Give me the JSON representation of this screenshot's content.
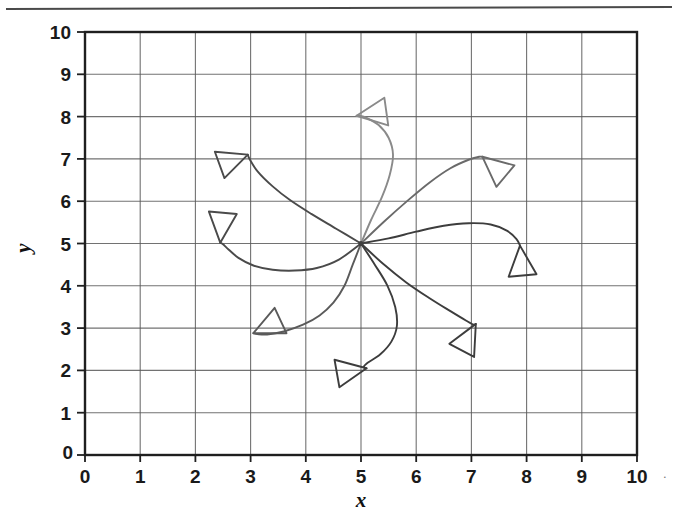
{
  "figure": {
    "background_color": "#ffffff",
    "ink_color": "#3f3f3f",
    "grid_color": "#5a5a5a",
    "axis_color": "#1f1f1f",
    "top_rule_present": true,
    "trailing_artifact": "."
  },
  "chart_data": {
    "type": "line",
    "title": "",
    "subtitle": "",
    "xlabel": "x",
    "ylabel": "y",
    "xlim": [
      0,
      10
    ],
    "ylim": [
      0,
      10
    ],
    "xticks": [
      0,
      1,
      2,
      3,
      4,
      5,
      6,
      7,
      8,
      9,
      10
    ],
    "yticks": [
      0,
      1,
      2,
      3,
      4,
      5,
      6,
      7,
      8,
      9,
      10
    ],
    "xtick_labels": [
      "0",
      "1",
      "2",
      "3",
      "4",
      "5",
      "6",
      "7",
      "8",
      "9",
      "10"
    ],
    "ytick_labels": [
      "0",
      "1",
      "2",
      "3",
      "4",
      "5",
      "6",
      "7",
      "8",
      "9",
      "10"
    ],
    "grid": true,
    "grid_style": "solid",
    "legend": false,
    "legend_position": "none",
    "annotations": [],
    "convergence_point": [
      5,
      5
    ],
    "marker_shape": "open-triangle-arrowhead",
    "series": [
      {
        "name": "path-1-up-left",
        "color": "#4a4a4a",
        "arrow_tip": [
          2.95,
          7.1
        ],
        "arrow_angle_deg": 20,
        "points": [
          [
            5.0,
            5.0
          ],
          [
            4.55,
            5.35
          ],
          [
            4.1,
            5.7
          ],
          [
            3.72,
            6.02
          ],
          [
            3.4,
            6.35
          ],
          [
            3.13,
            6.7
          ],
          [
            2.98,
            7.0
          ],
          [
            2.95,
            7.1
          ]
        ]
      },
      {
        "name": "path-2-left-down-hook",
        "color": "#4a4a4a",
        "arrow_tip": [
          2.45,
          5.02
        ],
        "arrow_angle_deg": 265,
        "points": [
          [
            5.0,
            5.0
          ],
          [
            4.6,
            4.62
          ],
          [
            4.2,
            4.42
          ],
          [
            3.8,
            4.36
          ],
          [
            3.4,
            4.38
          ],
          [
            3.05,
            4.48
          ],
          [
            2.78,
            4.66
          ],
          [
            2.6,
            4.86
          ],
          [
            2.5,
            4.98
          ],
          [
            2.45,
            5.02
          ]
        ]
      },
      {
        "name": "path-3-down-left",
        "color": "#5a5a5a",
        "arrow_tip": [
          3.05,
          2.88
        ],
        "arrow_angle_deg": 205,
        "points": [
          [
            5.0,
            5.0
          ],
          [
            4.85,
            4.5
          ],
          [
            4.7,
            4.0
          ],
          [
            4.5,
            3.6
          ],
          [
            4.25,
            3.3
          ],
          [
            3.95,
            3.08
          ],
          [
            3.6,
            2.92
          ],
          [
            3.3,
            2.85
          ],
          [
            3.12,
            2.86
          ],
          [
            3.05,
            2.88
          ]
        ]
      },
      {
        "name": "path-4-down-right-hook",
        "color": "#3d3d3d",
        "arrow_tip": [
          5.1,
          2.05
        ],
        "arrow_angle_deg": 10,
        "points": [
          [
            5.0,
            5.0
          ],
          [
            5.25,
            4.5
          ],
          [
            5.48,
            4.0
          ],
          [
            5.62,
            3.5
          ],
          [
            5.65,
            3.05
          ],
          [
            5.55,
            2.68
          ],
          [
            5.35,
            2.38
          ],
          [
            5.12,
            2.18
          ],
          [
            5.05,
            2.08
          ],
          [
            5.1,
            2.05
          ]
        ]
      },
      {
        "name": "path-5-down-right-arrow",
        "color": "#3d3d3d",
        "arrow_tip": [
          7.08,
          3.1
        ],
        "arrow_angle_deg": 62,
        "points": [
          [
            5.0,
            5.0
          ],
          [
            5.4,
            4.52
          ],
          [
            5.82,
            4.08
          ],
          [
            6.25,
            3.7
          ],
          [
            6.62,
            3.4
          ],
          [
            6.9,
            3.18
          ],
          [
            7.04,
            3.08
          ],
          [
            7.08,
            3.1
          ]
        ]
      },
      {
        "name": "path-6-right-up-hook",
        "color": "#3d3d3d",
        "arrow_tip": [
          7.88,
          4.95
        ],
        "arrow_angle_deg": 95,
        "points": [
          [
            5.0,
            5.0
          ],
          [
            5.5,
            5.12
          ],
          [
            6.0,
            5.28
          ],
          [
            6.5,
            5.42
          ],
          [
            6.95,
            5.48
          ],
          [
            7.35,
            5.45
          ],
          [
            7.65,
            5.3
          ],
          [
            7.82,
            5.1
          ],
          [
            7.88,
            4.95
          ]
        ]
      },
      {
        "name": "path-7-up-right",
        "color": "#6a6a6a",
        "arrow_tip": [
          7.2,
          7.05
        ],
        "arrow_angle_deg": 140,
        "points": [
          [
            5.0,
            5.0
          ],
          [
            5.42,
            5.52
          ],
          [
            5.85,
            6.02
          ],
          [
            6.25,
            6.45
          ],
          [
            6.62,
            6.78
          ],
          [
            6.95,
            6.98
          ],
          [
            7.14,
            7.05
          ],
          [
            7.2,
            7.05
          ]
        ]
      },
      {
        "name": "path-8-up-left-top",
        "color": "#8a8a8a",
        "arrow_tip": [
          4.92,
          8.02
        ],
        "arrow_angle_deg": 188,
        "points": [
          [
            5.0,
            5.0
          ],
          [
            5.18,
            5.55
          ],
          [
            5.38,
            6.1
          ],
          [
            5.52,
            6.62
          ],
          [
            5.58,
            7.1
          ],
          [
            5.5,
            7.5
          ],
          [
            5.32,
            7.8
          ],
          [
            5.1,
            7.97
          ],
          [
            4.98,
            8.02
          ],
          [
            4.92,
            8.02
          ]
        ]
      }
    ]
  },
  "plot_box": {
    "left_px": 85,
    "top_px": 32,
    "right_px": 637,
    "bottom_px": 455
  }
}
